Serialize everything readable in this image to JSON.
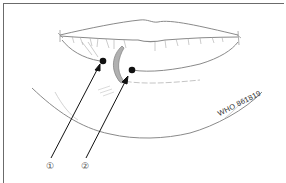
{
  "figure": {
    "callouts": [
      {
        "id": 1,
        "label": "①"
      },
      {
        "id": 2,
        "label": "②"
      }
    ],
    "watermark": "WHO 861819",
    "colors": {
      "line": "#8a8a8a",
      "arrow": "#111111",
      "lesion": "#9a9a9a",
      "frame": "#6b6b6b"
    }
  }
}
